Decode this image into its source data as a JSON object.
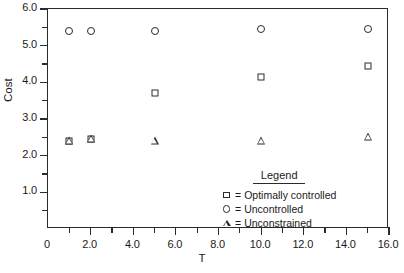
{
  "chart_data": {
    "type": "scatter",
    "title": "",
    "xlabel": "T",
    "ylabel": "Cost",
    "xlim": [
      0,
      16
    ],
    "ylim": [
      0,
      6
    ],
    "grid": false,
    "legend_position": "inside-lower-right",
    "legend_title": "Legend",
    "x_ticks": [
      0,
      2,
      4,
      6,
      8,
      10,
      12,
      14,
      16
    ],
    "x_tick_labels": [
      "0",
      "2.0",
      "4.0",
      "6.0",
      "8.0",
      "10.0",
      "12.0",
      "14.0",
      "16.0"
    ],
    "x_minor_ticks": [
      1,
      3,
      5,
      7,
      9,
      11,
      13,
      15
    ],
    "y_ticks": [
      1.0,
      2.0,
      3.0,
      4.0,
      5.0,
      6.0
    ],
    "y_tick_labels": [
      "1.0",
      "2.0",
      "3.0",
      "4.0",
      "5.0",
      "6.0"
    ],
    "y_minor_ticks": [
      0.5,
      1.5,
      2.5,
      3.5,
      4.5,
      5.5
    ],
    "x": [
      1,
      2,
      5,
      10,
      15
    ],
    "series": [
      {
        "name": "Optimally controlled",
        "marker": "square",
        "legend_glyph": "square",
        "values": [
          2.4,
          2.45,
          3.7,
          4.15,
          4.45
        ]
      },
      {
        "name": "Uncontrolled",
        "marker": "circle",
        "legend_glyph": "circle",
        "values": [
          5.4,
          5.4,
          5.4,
          5.45,
          5.45
        ]
      },
      {
        "name": "Unconstrained",
        "marker": "triangle",
        "legend_glyph": "triangle",
        "values": [
          2.4,
          2.45,
          2.4,
          2.4,
          2.5
        ]
      }
    ],
    "legend_entries": [
      {
        "glyph": "square",
        "equals": "=",
        "label": "Optimally controlled"
      },
      {
        "glyph": "circle",
        "equals": "=",
        "label": "Uncontrolled"
      },
      {
        "glyph": "triangle",
        "equals": "=",
        "label": "Unconstrained"
      }
    ],
    "colors": {
      "axis": "#2b2b2b",
      "marker": "#2b2b2b",
      "background": "#ffffff"
    }
  }
}
